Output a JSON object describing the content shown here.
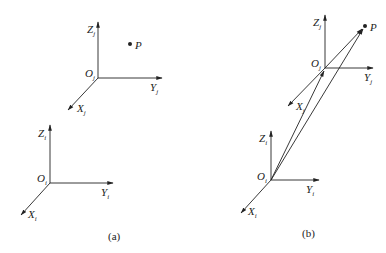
{
  "figure": {
    "panels": [
      {
        "id": "a",
        "caption": "(a)",
        "frames": [
          {
            "name": "j",
            "origin_label": "O",
            "origin_sub": "j",
            "x_label": "X",
            "x_sub": "j",
            "y_label": "Y",
            "y_sub": "j",
            "z_label": "Z",
            "z_sub": "j"
          },
          {
            "name": "i",
            "origin_label": "O",
            "origin_sub": "i",
            "x_label": "X",
            "x_sub": "i",
            "y_label": "Y",
            "y_sub": "i",
            "z_label": "Z",
            "z_sub": "i"
          }
        ],
        "point_label": "P"
      },
      {
        "id": "b",
        "caption": "(b)",
        "frames": [
          {
            "name": "j",
            "origin_label": "O",
            "origin_sub": "j",
            "x_label": "X",
            "x_sub": "j",
            "y_label": "Y",
            "y_sub": "j",
            "z_label": "Z",
            "z_sub": "j"
          },
          {
            "name": "i",
            "origin_label": "O",
            "origin_sub": "i",
            "x_label": "X",
            "x_sub": "i",
            "y_label": "Y",
            "y_sub": "i",
            "z_label": "Z",
            "z_sub": "i"
          }
        ],
        "point_label": "P",
        "vectors": [
          "Oi→Oj",
          "Oi→P",
          "Oj→P"
        ]
      }
    ]
  }
}
